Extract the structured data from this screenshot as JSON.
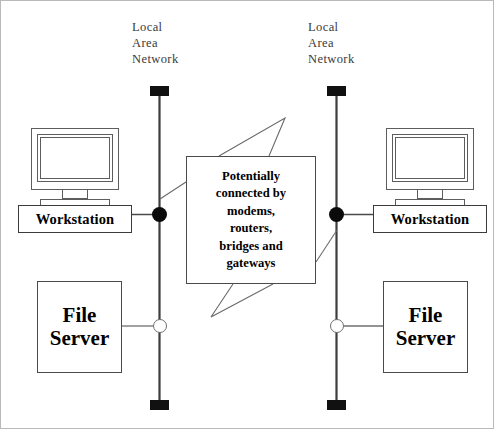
{
  "diagram": {
    "width": 494,
    "height": 429,
    "background": "#ffffff",
    "line_color": "#4a4a4a",
    "node_fill_color": "#0b0b0b",
    "terminator_color": "#111111"
  },
  "lan_left": {
    "label": "Local\nArea\nNetwork",
    "label_line1": "Local",
    "label_line2": "Area",
    "label_line3": "Network",
    "bus_x": 158,
    "workstation": {
      "label": "Workstation",
      "node_type": "filled-circle"
    },
    "file_server": {
      "label_line1": "File",
      "label_line2": "Server",
      "node_type": "hollow-circle"
    }
  },
  "lan_right": {
    "label": "Local\nArea\nNetwork",
    "label_line1": "Local",
    "label_line2": "Area",
    "label_line3": "Network",
    "bus_x": 336,
    "workstation": {
      "label": "Workstation",
      "node_type": "filled-circle"
    },
    "file_server": {
      "label_line1": "File",
      "label_line2": "Server",
      "node_type": "hollow-circle"
    }
  },
  "callout": {
    "text": "Potentially\nconnected by\nmodems,\nrouters,\nbridges and\ngateways",
    "line1": "Potentially",
    "line2": "connected by",
    "line3": "modems,",
    "line4": "routers,",
    "line5": "bridges and",
    "line6": "gateways"
  }
}
